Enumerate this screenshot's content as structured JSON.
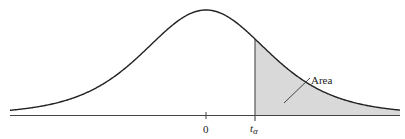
{
  "figure": {
    "type": "t-distribution-upper-tail",
    "labels": {
      "center_tick": "0",
      "critical_value_main": "t",
      "critical_value_sub": "α",
      "area_label": "Area"
    },
    "colors": {
      "curve": "#222222",
      "axis": "#444444",
      "shaded_area": "#d9d9d9",
      "critical_line": "#555555"
    }
  },
  "chart_data": {
    "type": "area",
    "title": "",
    "xlabel": "",
    "ylabel": "",
    "tick_labels": [
      "0",
      "tα"
    ],
    "shaded_region": {
      "from": "tα",
      "to": "+∞",
      "label": "Area"
    },
    "grid": false
  }
}
